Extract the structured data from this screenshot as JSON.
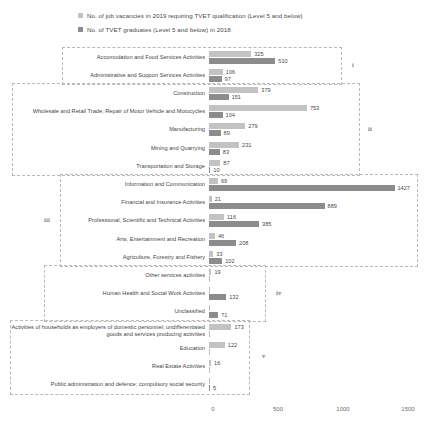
{
  "legend": {
    "items": [
      {
        "label": "No. of job vacancies in 2019 requiring TVET qualification  (Level 5 and below)",
        "color": "#c3c3c3",
        "key": "vacancies"
      },
      {
        "label": "No. of TVET graduates (Level 5 and below) in 2018",
        "color": "#8c8c8c",
        "key": "graduates"
      }
    ]
  },
  "chart_data": {
    "type": "bar",
    "orientation": "horizontal",
    "title": "",
    "xlabel": "",
    "ylabel": "",
    "xlim": [
      0,
      1600
    ],
    "ticks": [
      "0",
      "500",
      "1000",
      "1500"
    ],
    "tick_values": [
      0,
      500,
      1000,
      1500
    ],
    "grid": false,
    "legend_position": "top-left",
    "series": [
      {
        "name": "No. of job vacancies in 2019 requiring TVET qualification  (Level 5 and below)",
        "color": "#c3c3c3"
      },
      {
        "name": "No. of TVET graduates (Level 5 and below) in 2018",
        "color": "#8c8c8c"
      }
    ],
    "categories": [
      "Accomodation and Food Services Activities",
      "Administrative and Support Services Activities",
      "Construction",
      "Wholesale and Retail Trade; Repair of Motor Vehicle and Motocycles",
      "Manufacturing",
      "Mining and Quarrying",
      "Transportation and Storage",
      "Information and Communication",
      "Financial and Insurance Activities",
      "Professional, Scientific and Technical Activities",
      "Arts, Entertainment and Recreation",
      "Agriculture, Forestry and Fishery",
      "Other services activities",
      "Human Health and Social Work Activities",
      "Unclassified",
      "Activities of households as employers of domestic personnel; undifferentiated goods and services producing activities",
      "Education",
      "Real Estate Activities",
      "Public administration and defence; compulsory social security"
    ],
    "values": {
      "vacancies": [
        325,
        106,
        379,
        753,
        279,
        231,
        87,
        69,
        21,
        116,
        46,
        33,
        19,
        0,
        0,
        173,
        122,
        16,
        0
      ],
      "graduates": [
        510,
        97,
        151,
        104,
        89,
        83,
        10,
        1427,
        889,
        385,
        208,
        102,
        0,
        132,
        71,
        0,
        0,
        0,
        5
      ]
    },
    "rows": [
      {
        "category": "Accomodation and Food Services Activities",
        "vacancies": 325,
        "graduates": 510,
        "group": "i"
      },
      {
        "category": "Administrative and Support Services Activities",
        "vacancies": 106,
        "graduates": 97,
        "group": "i"
      },
      {
        "category": "Construction",
        "vacancies": 379,
        "graduates": 151,
        "group": "ii"
      },
      {
        "category": "Wholesale and Retail Trade; Repair of Motor Vehicle and Motocycles",
        "vacancies": 753,
        "graduates": 104,
        "group": "ii"
      },
      {
        "category": "Manufacturing",
        "vacancies": 279,
        "graduates": 89,
        "group": "ii"
      },
      {
        "category": "Mining and Quarrying",
        "vacancies": 231,
        "graduates": 83,
        "group": "ii"
      },
      {
        "category": "Transportation and Storage",
        "vacancies": 87,
        "graduates": 10,
        "group": "ii"
      },
      {
        "category": "Information and Communication",
        "vacancies": 69,
        "graduates": 1427,
        "group": "iii"
      },
      {
        "category": "Financial and Insurance Activities",
        "vacancies": 21,
        "graduates": 889,
        "group": "iii"
      },
      {
        "category": "Professional, Scientific and Technical Activities",
        "vacancies": 116,
        "graduates": 385,
        "group": "iii"
      },
      {
        "category": "Arts, Entertainment and Recreation",
        "vacancies": 46,
        "graduates": 208,
        "group": "iii"
      },
      {
        "category": "Agriculture, Forestry and Fishery",
        "vacancies": 33,
        "graduates": 102,
        "group": "iii"
      },
      {
        "category": "Other services activities",
        "vacancies": 19,
        "graduates": null,
        "group": "iv"
      },
      {
        "category": "Human Health and Social Work Activities",
        "vacancies": null,
        "graduates": 132,
        "group": "iv"
      },
      {
        "category": "Unclassified",
        "vacancies": null,
        "graduates": 71,
        "group": "iv"
      },
      {
        "category": "Activities of households as employers of domestic personnel; undifferentiated goods and services producing activities",
        "vacancies": 173,
        "graduates": null,
        "group": "v"
      },
      {
        "category": "Education",
        "vacancies": 122,
        "graduates": null,
        "group": "v"
      },
      {
        "category": "Real Estate Activities",
        "vacancies": 16,
        "graduates": null,
        "group": "v"
      },
      {
        "category": "Public administration and defence; compulsory social security",
        "vacancies": null,
        "graduates": 5,
        "group": "v"
      }
    ],
    "groups": [
      {
        "tag": "i",
        "rows": [
          0,
          1
        ]
      },
      {
        "tag": "ii",
        "rows": [
          2,
          3,
          4,
          5,
          6
        ]
      },
      {
        "tag": "iii",
        "rows": [
          7,
          8,
          9,
          10,
          11
        ]
      },
      {
        "tag": "iv",
        "rows": [
          12,
          13,
          14
        ]
      },
      {
        "tag": "v",
        "rows": [
          15,
          16,
          17,
          18
        ]
      }
    ]
  }
}
